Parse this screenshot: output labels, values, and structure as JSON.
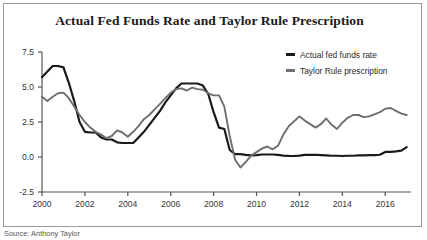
{
  "figure": {
    "title": "Actual Fed Funds Rate and Taylor Rule Prescription",
    "caption": "Source: Anthony Taylor",
    "border_color": "#9a9a9a",
    "background": "#ffffff"
  },
  "legend": {
    "position": "top-right",
    "entries": [
      {
        "label": "Actual fed funds rate",
        "color": "#1a1a1a",
        "swatch": "line-swatch"
      },
      {
        "label": "Taylor Rule prescription",
        "color": "#6e6e6e",
        "swatch": "line-swatch"
      }
    ]
  },
  "chart_data": {
    "type": "line",
    "title": "Actual Fed Funds Rate and Taylor Rule Prescription",
    "xlabel": "",
    "ylabel": "",
    "xlim": [
      2000,
      2017.2
    ],
    "ylim": [
      -2.5,
      7.5
    ],
    "yticks": [
      -2.5,
      0.0,
      2.5,
      5.0,
      7.5
    ],
    "ytick_labels": [
      "-2.5",
      "0.0",
      "2.5",
      "5.0",
      "7.5"
    ],
    "xticks": [
      2000,
      2002,
      2004,
      2006,
      2008,
      2010,
      2012,
      2014,
      2016
    ],
    "xtick_labels": [
      "2000",
      "2002",
      "2004",
      "2006",
      "2008",
      "2010",
      "2012",
      "2014",
      "2016"
    ],
    "grid": false,
    "x": [
      2000.0,
      2000.25,
      2000.5,
      2000.75,
      2001.0,
      2001.25,
      2001.5,
      2001.75,
      2002.0,
      2002.25,
      2002.5,
      2002.75,
      2003.0,
      2003.25,
      2003.5,
      2003.75,
      2004.0,
      2004.25,
      2004.5,
      2004.75,
      2005.0,
      2005.25,
      2005.5,
      2005.75,
      2006.0,
      2006.25,
      2006.5,
      2006.75,
      2007.0,
      2007.25,
      2007.5,
      2007.75,
      2008.0,
      2008.25,
      2008.5,
      2008.75,
      2009.0,
      2009.25,
      2009.5,
      2009.75,
      2010.0,
      2010.25,
      2010.5,
      2010.75,
      2011.0,
      2011.25,
      2011.5,
      2011.75,
      2012.0,
      2012.25,
      2012.5,
      2012.75,
      2013.0,
      2013.25,
      2013.5,
      2013.75,
      2014.0,
      2014.25,
      2014.5,
      2014.75,
      2015.0,
      2015.25,
      2015.5,
      2015.75,
      2016.0,
      2016.25,
      2016.5,
      2016.75,
      2017.0
    ],
    "series": [
      {
        "name": "Actual fed funds rate",
        "color": "#1a1a1a",
        "values": [
          5.7,
          6.1,
          6.5,
          6.5,
          6.4,
          5.3,
          4.0,
          2.5,
          1.8,
          1.75,
          1.75,
          1.4,
          1.25,
          1.25,
          1.05,
          1.0,
          1.0,
          1.0,
          1.4,
          1.8,
          2.3,
          2.8,
          3.3,
          3.9,
          4.4,
          4.9,
          5.25,
          5.25,
          5.25,
          5.25,
          5.1,
          4.5,
          3.2,
          2.1,
          2.0,
          0.5,
          0.2,
          0.2,
          0.15,
          0.12,
          0.13,
          0.18,
          0.18,
          0.18,
          0.15,
          0.1,
          0.08,
          0.07,
          0.1,
          0.15,
          0.15,
          0.16,
          0.14,
          0.12,
          0.09,
          0.09,
          0.07,
          0.09,
          0.09,
          0.11,
          0.11,
          0.13,
          0.14,
          0.16,
          0.36,
          0.37,
          0.4,
          0.45,
          0.7
        ]
      },
      {
        "name": "Taylor Rule prescription",
        "color": "#6e6e6e",
        "values": [
          4.3,
          4.0,
          4.3,
          4.55,
          4.6,
          4.2,
          3.6,
          3.0,
          2.5,
          2.1,
          1.8,
          1.6,
          1.35,
          1.5,
          1.9,
          1.75,
          1.45,
          1.8,
          2.2,
          2.7,
          3.0,
          3.4,
          3.8,
          4.2,
          4.6,
          4.85,
          4.9,
          4.75,
          4.95,
          4.85,
          4.8,
          4.55,
          4.4,
          4.4,
          3.6,
          1.5,
          -0.2,
          -0.75,
          -0.35,
          0.1,
          0.35,
          0.6,
          0.75,
          0.55,
          0.8,
          1.6,
          2.2,
          2.55,
          2.9,
          2.6,
          2.35,
          2.1,
          2.35,
          2.75,
          2.3,
          2.0,
          2.45,
          2.8,
          3.0,
          3.0,
          2.85,
          2.9,
          3.05,
          3.2,
          3.45,
          3.5,
          3.3,
          3.1,
          3.0
        ]
      }
    ]
  }
}
